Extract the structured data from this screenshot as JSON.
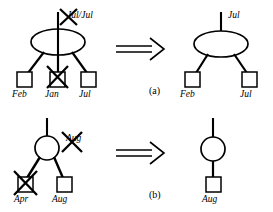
{
  "figure": {
    "type": "diagram",
    "panels": [
      {
        "id": "a",
        "caption": "(a)",
        "left_tree": {
          "root_shape": "ellipse",
          "root_edge_label": "Jul/Jul",
          "root_edge_label_struck": true,
          "leaves": [
            {
              "label": "Feb",
              "shape": "square",
              "struck": false
            },
            {
              "label": "Jan",
              "shape": "square",
              "struck": true
            },
            {
              "label": "Jul",
              "shape": "square",
              "struck": false
            }
          ]
        },
        "arrow": "double-right-arrow",
        "right_tree": {
          "root_shape": "ellipse",
          "root_edge_label": "Jul",
          "root_edge_label_struck": false,
          "leaves": [
            {
              "label": "Feb",
              "shape": "square",
              "struck": false
            },
            {
              "label": "Jul",
              "shape": "square",
              "struck": false
            }
          ]
        }
      },
      {
        "id": "b",
        "caption": "(b)",
        "left_tree": {
          "root_shape": "circle",
          "root_edge_label": "Aug",
          "root_edge_label_struck": true,
          "leaves": [
            {
              "label": "Apr",
              "shape": "square",
              "struck": true
            },
            {
              "label": "Aug",
              "shape": "square",
              "struck": false
            }
          ]
        },
        "arrow": "double-right-arrow",
        "right_tree": {
          "root_shape": "circle",
          "root_edge_label": "",
          "root_edge_label_struck": false,
          "leaves": [
            {
              "label": "Aug",
              "shape": "square",
              "struck": false
            }
          ]
        }
      }
    ],
    "colors": {
      "stroke": "#000000",
      "background": "#ffffff"
    }
  }
}
